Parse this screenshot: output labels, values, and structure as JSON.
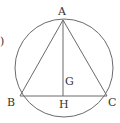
{
  "diagram": {
    "problem_marker": ")",
    "labels": {
      "A": "A",
      "B": "B",
      "C": "C",
      "G": "G",
      "H": "H"
    },
    "stroke_color": "#6a6a6a",
    "text_color": "#333333",
    "circle": {
      "cx": 64,
      "cy": 68,
      "r": 49
    },
    "points": {
      "A": [
        63,
        20
      ],
      "B": [
        20,
        96
      ],
      "C": [
        107,
        96
      ],
      "H": [
        63,
        96
      ]
    }
  }
}
